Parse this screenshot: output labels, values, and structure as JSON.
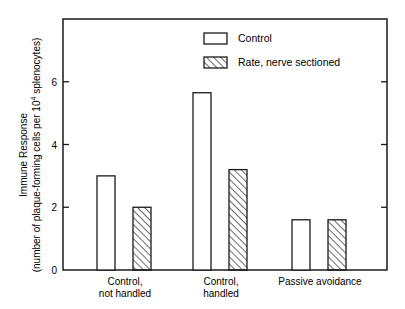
{
  "chart_data": {
    "type": "bar",
    "title": "",
    "xlabel": "",
    "ylabel": "Immune Response",
    "ylabel_sub": "(number of plaque-forming cells per 10^4 splenocytes)",
    "ylabel_sub_parts": {
      "pre": "(number of plaque-forming cells per 10",
      "sup": "4",
      "post": " splenocytes)"
    },
    "categories": [
      [
        "Control,",
        "not handled"
      ],
      [
        "Control,",
        "handled"
      ],
      [
        "Passive avoidance"
      ]
    ],
    "series": [
      {
        "name": "Control",
        "pattern": "open",
        "values": [
          3.0,
          5.65,
          1.6
        ]
      },
      {
        "name": "Rate, nerve sectioned",
        "pattern": "hatched",
        "values": [
          2.0,
          3.2,
          1.6
        ]
      }
    ],
    "ylim": [
      0,
      8
    ],
    "yticks": [
      0,
      2,
      4,
      6
    ],
    "grid": false,
    "legend_position": "upper-center-right"
  },
  "colors": {
    "ink": "#1a1a1a",
    "background": "#ffffff"
  }
}
